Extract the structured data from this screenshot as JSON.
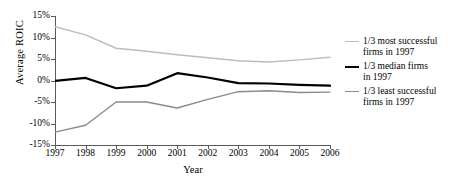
{
  "chart_data": {
    "type": "line",
    "title": "",
    "xlabel": "Year",
    "ylabel": "Average ROIC",
    "x": [
      1997,
      1998,
      1999,
      2000,
      2001,
      2002,
      2003,
      2004,
      2005,
      2006
    ],
    "categories": [
      "1997",
      "1998",
      "1999",
      "2000",
      "2001",
      "2002",
      "2003",
      "2004",
      "2005",
      "2006"
    ],
    "xlim": [
      1997,
      2006
    ],
    "ylim": [
      -15,
      15
    ],
    "yticks": [
      15,
      10,
      5,
      0,
      -5,
      -10,
      -15
    ],
    "ytick_labels": [
      "15%",
      "10%",
      "5%",
      "0%",
      "-5%",
      "-10%",
      "-15%"
    ],
    "grid": false,
    "legend_position": "right",
    "series": [
      {
        "name": "1/3 most successful firms in 1997",
        "color": "#bdbdbd",
        "width": 1.4,
        "values": [
          12.5,
          10.6,
          7.5,
          6.8,
          6.0,
          5.3,
          4.6,
          4.3,
          4.8,
          5.4
        ]
      },
      {
        "name": "1/3 median firms in 1997",
        "color": "#000000",
        "width": 2.2,
        "values": [
          -0.1,
          0.6,
          -1.8,
          -1.2,
          1.7,
          0.7,
          -0.6,
          -0.7,
          -1.0,
          -1.2
        ]
      },
      {
        "name": "1/3 least successful firms in 1997",
        "color": "#8a8a8a",
        "width": 1.4,
        "values": [
          -12.0,
          -10.4,
          -5.0,
          -5.0,
          -6.4,
          -4.4,
          -2.6,
          -2.4,
          -2.8,
          -2.7
        ]
      }
    ]
  },
  "legend": {
    "items": [
      {
        "line1": "1/3 most successful",
        "line2": "firms in 1997",
        "color": "#bdbdbd",
        "width": "1.5px"
      },
      {
        "line1": "1/3 median firms",
        "line2": "in 1997",
        "color": "#000000",
        "width": "2.4px"
      },
      {
        "line1": "1/3 least successful",
        "line2": "firms in 1997",
        "color": "#8a8a8a",
        "width": "1.5px"
      }
    ]
  }
}
